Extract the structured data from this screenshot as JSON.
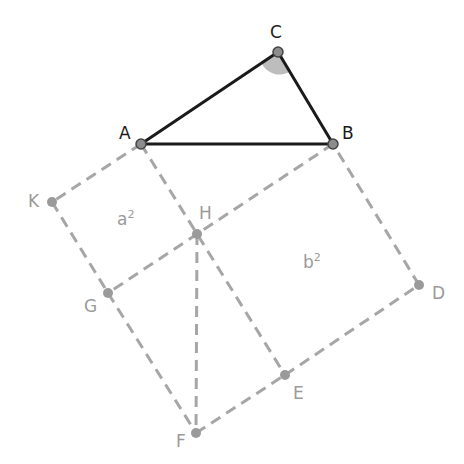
{
  "colors": {
    "triangle_stroke": "#1a1a1a",
    "construction_stroke": "#a6a6a6",
    "point_fill": "#8c8c8c",
    "point_stroke": "#555555",
    "angle_fill": "#bdbdbd",
    "label_dark": "#1a1a1a",
    "label_light": "#9a9a9a"
  },
  "points": {
    "A": {
      "label": "A",
      "x": 141,
      "y": 144
    },
    "B": {
      "label": "B",
      "x": 333,
      "y": 144
    },
    "C": {
      "label": "C",
      "x": 278,
      "y": 52
    },
    "K": {
      "label": "K",
      "x": 52,
      "y": 202
    },
    "H": {
      "label": "H",
      "x": 197,
      "y": 234
    },
    "G": {
      "label": "G",
      "x": 108,
      "y": 293
    },
    "D": {
      "label": "D",
      "x": 419,
      "y": 285
    },
    "E": {
      "label": "E",
      "x": 285,
      "y": 375
    },
    "F": {
      "label": "F",
      "x": 196,
      "y": 433
    }
  },
  "area_labels": {
    "a2": {
      "base": "a",
      "exp": "2"
    },
    "b2": {
      "base": "b",
      "exp": "2"
    }
  },
  "angle_marker": {
    "vertex": "C",
    "description": "right angle at C"
  }
}
